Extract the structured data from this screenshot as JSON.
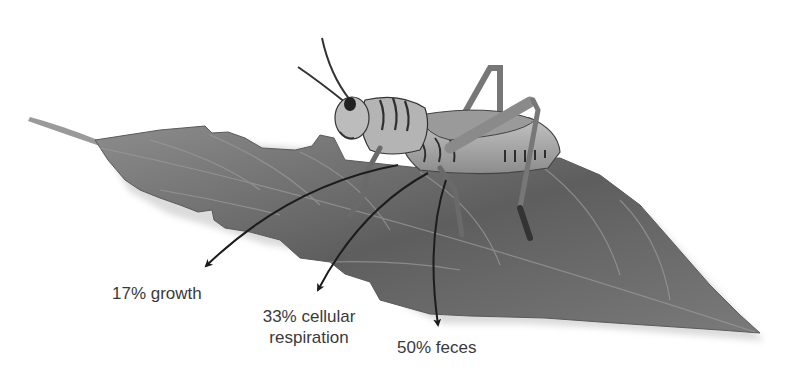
{
  "diagram": {
    "labels": {
      "growth": "17% growth",
      "cellular_respiration_line1": "33% cellular",
      "cellular_respiration_line2": "respiration",
      "feces": "50% feces"
    },
    "allocations": [
      {
        "name": "growth",
        "percent": 17
      },
      {
        "name": "cellular respiration",
        "percent": 33
      },
      {
        "name": "feces",
        "percent": 50
      }
    ],
    "colors": {
      "leaf": "#6e6e6e",
      "leaf_dark": "#4e4e4e",
      "leaf_light": "#8a8a8a",
      "insect_body": "#a8a8a8",
      "insect_stripe": "#2e2e2e",
      "arrow": "#1c1c1c",
      "text": "#3a3a3a"
    }
  }
}
